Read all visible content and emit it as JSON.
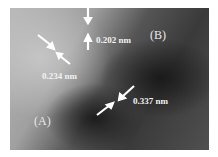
{
  "figure": {
    "type": "HRTEM lattice image",
    "regions": [
      {
        "id": "A",
        "label": "(A)"
      },
      {
        "id": "B",
        "label": "(B)"
      }
    ],
    "spacings": [
      {
        "label": "0.202 nm"
      },
      {
        "label": "0.234 nm"
      },
      {
        "label": "0.337 nm"
      }
    ]
  }
}
